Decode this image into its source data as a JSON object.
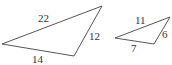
{
  "diagram": {
    "type": "similar-triangles",
    "triangles": [
      {
        "name": "large",
        "vertices": [
          [
            2,
            44
          ],
          [
            102,
            6
          ],
          [
            74,
            56
          ]
        ],
        "sides": {
          "top": "22",
          "right": "12",
          "bottom": "14"
        }
      },
      {
        "name": "small",
        "vertices": [
          [
            115,
            38
          ],
          [
            170,
            17
          ],
          [
            154,
            44
          ]
        ],
        "sides": {
          "top": "11",
          "right": "6",
          "bottom": "7"
        }
      }
    ]
  }
}
